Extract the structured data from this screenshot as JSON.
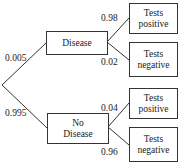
{
  "diagram": {
    "type": "probability-tree",
    "root_branches": [
      {
        "label": "Disease",
        "probability": "0.005",
        "outcomes": [
          {
            "label": "Tests positive",
            "line1": "Tests",
            "line2": "positive",
            "probability": "0.98"
          },
          {
            "label": "Tests negative",
            "line1": "Tests",
            "line2": "negative",
            "probability": "0.02"
          }
        ]
      },
      {
        "label": "No Disease",
        "line1": "No",
        "line2": "Disease",
        "probability": "0.995",
        "outcomes": [
          {
            "label": "Tests positive",
            "line1": "Tests",
            "line2": "positive",
            "probability": "0.04"
          },
          {
            "label": "Tests negative",
            "line1": "Tests",
            "line2": "negative",
            "probability": "0.96"
          }
        ]
      }
    ]
  },
  "colors": {
    "line": "#333333",
    "text": "#222222",
    "background": "#ffffff"
  }
}
